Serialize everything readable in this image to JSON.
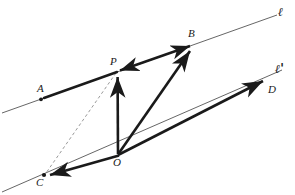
{
  "figure": {
    "background_color": "#ffffff",
    "stroke_color": "#1a1a1a",
    "thin_line_color": "#555555",
    "dashed_line_color": "#9a9a9a",
    "width": 295,
    "height": 195
  },
  "labels": {
    "line_l": "ℓ",
    "line_l_prime": "ℓ'",
    "point_a": "A",
    "point_b": "B",
    "point_c": "C",
    "point_d": "D",
    "point_o": "O",
    "point_p": "P"
  },
  "geometry": {
    "points": {
      "A": {
        "x": 41,
        "y": 99
      },
      "B": {
        "x": 193,
        "y": 45
      },
      "C": {
        "x": 44,
        "y": 175
      },
      "D": {
        "x": 267,
        "y": 80
      },
      "O": {
        "x": 118,
        "y": 155
      },
      "P": {
        "x": 117,
        "y": 71
      }
    },
    "line_l": {
      "x1": 2,
      "y1": 113,
      "x2": 277,
      "y2": 15
    },
    "line_l_prime": {
      "x1": 2,
      "y1": 192,
      "x2": 282,
      "y2": 70
    },
    "segments": [
      {
        "name": "A-to-P",
        "kind": "solid-thick",
        "from": "A",
        "to": "P",
        "arrow": "none"
      },
      {
        "name": "P-to-B",
        "kind": "solid-thick",
        "from": "P",
        "to": "B",
        "arrow": "both"
      },
      {
        "name": "O-to-P",
        "kind": "solid-thick",
        "from": "O",
        "to": "P",
        "arrow": "end"
      },
      {
        "name": "O-to-B",
        "kind": "solid-thick",
        "from": "O",
        "to": "B",
        "arrow": "end"
      },
      {
        "name": "O-to-C",
        "kind": "solid-thick",
        "from": "O",
        "to": "C",
        "arrow": "end"
      },
      {
        "name": "O-to-D",
        "kind": "solid-thick",
        "from": "O",
        "to": "D",
        "arrow": "end"
      },
      {
        "name": "P-to-C",
        "kind": "dashed",
        "from": "P",
        "to": "C",
        "arrow": "none"
      }
    ],
    "dots": [
      "A",
      "C"
    ]
  }
}
